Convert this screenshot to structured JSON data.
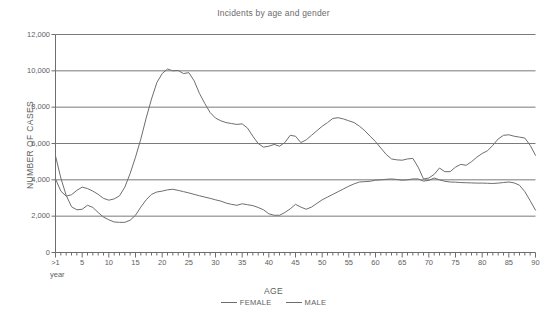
{
  "chart_data": {
    "type": "line",
    "title": "Incidents by age and gender",
    "xlabel": "AGE",
    "ylabel": "NUMBER OF CASES",
    "xlim": [
      0,
      90
    ],
    "ylim": [
      0,
      12000
    ],
    "grid": "horizontal",
    "legend_position": "bottom",
    "x_axis_note": ">1 year",
    "yticks": [
      0,
      2000,
      4000,
      6000,
      8000,
      10000,
      12000
    ],
    "ytick_labels": [
      "0",
      "2,000",
      "4,000",
      "6,000",
      "8,000",
      "10,000",
      "12,000"
    ],
    "xticks": [
      0,
      5,
      10,
      15,
      20,
      25,
      30,
      35,
      40,
      45,
      50,
      55,
      60,
      65,
      70,
      75,
      80,
      85,
      90
    ],
    "xtick_labels": [
      ">1",
      "5",
      "10",
      "15",
      "20",
      "25",
      "30",
      "35",
      "40",
      "45",
      "50",
      "55",
      "60",
      "65",
      "70",
      "75",
      "80",
      "85",
      "90"
    ],
    "x": [
      0,
      1,
      2,
      3,
      4,
      5,
      6,
      7,
      8,
      9,
      10,
      11,
      12,
      13,
      14,
      15,
      16,
      17,
      18,
      19,
      20,
      21,
      22,
      23,
      24,
      25,
      26,
      27,
      28,
      29,
      30,
      31,
      32,
      33,
      34,
      35,
      36,
      37,
      38,
      39,
      40,
      41,
      42,
      43,
      44,
      45,
      46,
      47,
      48,
      49,
      50,
      51,
      52,
      53,
      54,
      55,
      56,
      57,
      58,
      59,
      60,
      61,
      62,
      63,
      64,
      65,
      66,
      67,
      68,
      69,
      70,
      71,
      72,
      73,
      74,
      75,
      76,
      77,
      78,
      79,
      80,
      81,
      82,
      83,
      84,
      85,
      86,
      87,
      88,
      89,
      90
    ],
    "series": [
      {
        "name": "MALE",
        "color": "#6e6e6e",
        "values": [
          4050,
          3380,
          3100,
          3180,
          3420,
          3600,
          3520,
          3380,
          3200,
          2980,
          2880,
          2950,
          3120,
          3600,
          4350,
          5250,
          6250,
          7400,
          8450,
          9350,
          9850,
          10100,
          10000,
          10020,
          9850,
          9900,
          9450,
          8750,
          8200,
          7700,
          7400,
          7250,
          7150,
          7100,
          7050,
          7080,
          6850,
          6400,
          6000,
          5800,
          5850,
          5950,
          5850,
          6050,
          6450,
          6400,
          6050,
          6200,
          6450,
          6700,
          6950,
          7150,
          7380,
          7420,
          7350,
          7250,
          7150,
          6950,
          6700,
          6400,
          6100,
          5750,
          5400,
          5150,
          5100,
          5080,
          5150,
          5180,
          4700,
          4050,
          4100,
          4300,
          4650,
          4450,
          4450,
          4700,
          4850,
          4800,
          5000,
          5250,
          5450,
          5600,
          5900,
          6250,
          6450,
          6480,
          6400,
          6350,
          6300,
          5900,
          5350
        ]
      },
      {
        "name": "FEMALE",
        "color": "#6e6e6e",
        "values": [
          5320,
          4100,
          3150,
          2520,
          2350,
          2380,
          2600,
          2480,
          2200,
          1950,
          1800,
          1680,
          1660,
          1660,
          1780,
          2050,
          2500,
          2900,
          3200,
          3330,
          3380,
          3450,
          3480,
          3420,
          3350,
          3280,
          3200,
          3120,
          3050,
          2980,
          2900,
          2830,
          2720,
          2650,
          2600,
          2680,
          2630,
          2580,
          2480,
          2350,
          2130,
          2050,
          2050,
          2200,
          2400,
          2650,
          2500,
          2380,
          2500,
          2700,
          2900,
          3050,
          3200,
          3350,
          3500,
          3650,
          3780,
          3880,
          3900,
          3920,
          3980,
          4000,
          4030,
          4050,
          4020,
          3980,
          4000,
          4050,
          4050,
          3930,
          3970,
          4100,
          4000,
          3920,
          3880,
          3870,
          3850,
          3840,
          3830,
          3820,
          3820,
          3810,
          3800,
          3820,
          3850,
          3880,
          3830,
          3700,
          3350,
          2850,
          2330
        ]
      }
    ]
  },
  "axis": {
    "year_note": "year"
  }
}
